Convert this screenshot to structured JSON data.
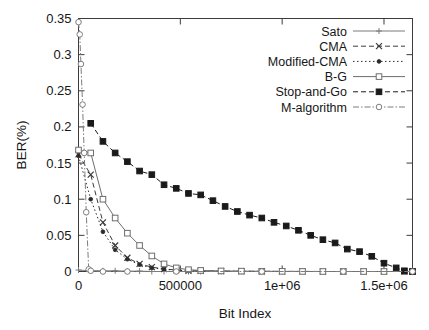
{
  "chart_data": {
    "type": "line",
    "title": "",
    "xlabel": "Bit Index",
    "ylabel": "BER(%)",
    "xlim": [
      0,
      1640000
    ],
    "ylim": [
      0,
      0.35
    ],
    "grid": false,
    "legend_position": "top-right",
    "xticks": [
      0,
      500000,
      1000000,
      1500000
    ],
    "xtick_labels": [
      "0",
      "500000",
      "1e+06",
      "1.5e+06"
    ],
    "yticks": [
      0,
      0.05,
      0.1,
      0.15,
      0.2,
      0.25,
      0.3,
      0.35
    ],
    "ytick_labels": [
      "0",
      "0.05",
      "0.1",
      "0.15",
      "0.2",
      "0.25",
      "0.3",
      "0.35"
    ],
    "series": [
      {
        "name": "Sato",
        "marker": "plus",
        "line": "solid",
        "color": "#7a7a7a",
        "x": [
          0,
          60000,
          120000,
          180000,
          240000,
          300000,
          360000,
          420000,
          480000,
          540000,
          600000,
          700000,
          800000,
          900000,
          1000000,
          1100000,
          1200000,
          1300000,
          1400000,
          1500000,
          1600000,
          1640000
        ],
        "y": [
          0.002,
          0.001,
          0.001,
          0.001,
          0.0005,
          0.0005,
          0,
          0,
          0,
          0,
          0,
          0,
          0,
          0,
          0,
          0,
          0,
          0,
          0,
          0,
          0,
          0
        ]
      },
      {
        "name": "CMA",
        "marker": "cross",
        "line": "dashed",
        "color": "#3a3a3a",
        "x": [
          0,
          60000,
          120000,
          180000,
          240000,
          300000,
          360000,
          420000,
          480000,
          540000,
          600000,
          700000,
          800000,
          900000,
          1000000,
          1100000,
          1200000,
          1300000,
          1400000,
          1500000,
          1600000,
          1640000
        ],
        "y": [
          0.162,
          0.134,
          0.068,
          0.036,
          0.019,
          0.0105,
          0.006,
          0.0035,
          0.002,
          0.001,
          0.0008,
          0.0005,
          0.0003,
          0.0002,
          0.0001,
          0.0001,
          0,
          0,
          0,
          0,
          0,
          0
        ]
      },
      {
        "name": "Modified-CMA",
        "marker": "dot",
        "line": "dotted",
        "color": "#2b2b2b",
        "x": [
          0,
          60000,
          120000,
          180000,
          240000,
          300000,
          360000,
          420000,
          480000,
          540000,
          600000,
          700000,
          800000,
          900000,
          1000000,
          1100000,
          1200000,
          1300000,
          1400000,
          1500000,
          1600000,
          1640000
        ],
        "y": [
          0.16,
          0.1,
          0.055,
          0.03,
          0.017,
          0.0095,
          0.005,
          0.003,
          0.0018,
          0.001,
          0.0006,
          0.0004,
          0.0002,
          0.0001,
          0.0001,
          0,
          0,
          0,
          0,
          0,
          0,
          0
        ]
      },
      {
        "name": "B-G",
        "marker": "open-square",
        "line": "solid",
        "color": "#6e6e6e",
        "x": [
          0,
          60000,
          120000,
          180000,
          240000,
          300000,
          360000,
          420000,
          480000,
          540000,
          600000,
          700000,
          800000,
          900000,
          1000000,
          1100000,
          1200000,
          1300000,
          1400000,
          1500000,
          1600000,
          1640000
        ],
        "y": [
          0.168,
          0.164,
          0.1,
          0.074,
          0.053,
          0.036,
          0.0215,
          0.0105,
          0.005,
          0.0025,
          0.0015,
          0.0008,
          0.0005,
          0.0003,
          0.0002,
          0.0001,
          0,
          0,
          0,
          0,
          0,
          0
        ]
      },
      {
        "name": "Stop-and-Go",
        "marker": "filled-square",
        "line": "dashed",
        "color": "#1a1a1a",
        "x": [
          60000,
          120000,
          180000,
          240000,
          300000,
          360000,
          420000,
          480000,
          540000,
          600000,
          660000,
          720000,
          780000,
          840000,
          900000,
          960000,
          1020000,
          1080000,
          1140000,
          1200000,
          1260000,
          1320000,
          1380000,
          1440000,
          1500000,
          1560000,
          1600000,
          1640000
        ],
        "y": [
          0.205,
          0.18,
          0.164,
          0.152,
          0.139,
          0.134,
          0.12,
          0.115,
          0.108,
          0.106,
          0.098,
          0.09,
          0.083,
          0.078,
          0.074,
          0.068,
          0.063,
          0.057,
          0.05,
          0.044,
          0.0395,
          0.031,
          0.0275,
          0.021,
          0.0115,
          0.005,
          0.001,
          0
        ]
      },
      {
        "name": "M-algorithm",
        "marker": "open-circle",
        "line": "dash-dot",
        "color": "#7d7d7d",
        "x": [
          0,
          6000,
          12000,
          20000,
          28000,
          38000,
          50000,
          60000,
          120000,
          240000,
          480000,
          900000,
          1300000,
          1640000
        ],
        "y": [
          0.345,
          0.328,
          0.287,
          0.231,
          0.164,
          0.082,
          0.003,
          0.001,
          0,
          0,
          0,
          0,
          0,
          0
        ]
      }
    ]
  },
  "legend": {
    "entries": [
      {
        "label": "Sato"
      },
      {
        "label": "CMA"
      },
      {
        "label": "Modified-CMA"
      },
      {
        "label": "B-G"
      },
      {
        "label": "Stop-and-Go"
      },
      {
        "label": "M-algorithm"
      }
    ]
  }
}
